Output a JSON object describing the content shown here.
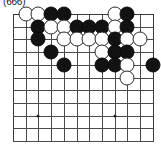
{
  "caption": {
    "text": "(666)"
  },
  "board": {
    "name": "go-board",
    "columns": 12,
    "rows": 11,
    "cell_size": 12.7,
    "origin_x": 3,
    "origin_y": 3,
    "line_color": "#4a4a4a",
    "background_color": "#ffffff",
    "black_color": "#121212",
    "white_color": "#ffffff",
    "star_points": [
      {
        "col": 3,
        "row": 9
      },
      {
        "col": 9,
        "row": 9
      }
    ],
    "stones": [
      {
        "color": "white",
        "col": 2,
        "row": 1
      },
      {
        "color": "white",
        "col": 3,
        "row": 1
      },
      {
        "color": "black",
        "col": 4,
        "row": 1
      },
      {
        "color": "black",
        "col": 5,
        "row": 1
      },
      {
        "color": "white",
        "col": 9,
        "row": 1
      },
      {
        "color": "black",
        "col": 10,
        "row": 1
      },
      {
        "color": "black",
        "col": 3,
        "row": 2
      },
      {
        "color": "white",
        "col": 4,
        "row": 2
      },
      {
        "color": "white",
        "col": 5,
        "row": 2
      },
      {
        "color": "black",
        "col": 6,
        "row": 2
      },
      {
        "color": "black",
        "col": 7,
        "row": 2
      },
      {
        "color": "black",
        "col": 8,
        "row": 2
      },
      {
        "color": "white",
        "col": 9,
        "row": 2
      },
      {
        "color": "black",
        "col": 10,
        "row": 2
      },
      {
        "color": "black",
        "col": 3,
        "row": 3
      },
      {
        "color": "white",
        "col": 5,
        "row": 3
      },
      {
        "color": "white",
        "col": 6,
        "row": 3
      },
      {
        "color": "white",
        "col": 7,
        "row": 3
      },
      {
        "color": "white",
        "col": 8,
        "row": 3
      },
      {
        "color": "black",
        "col": 9,
        "row": 3
      },
      {
        "color": "white",
        "col": 10,
        "row": 3
      },
      {
        "color": "white",
        "col": 11,
        "row": 3
      },
      {
        "color": "black",
        "col": 4,
        "row": 4
      },
      {
        "color": "white",
        "col": 8,
        "row": 4
      },
      {
        "color": "black",
        "col": 9,
        "row": 4
      },
      {
        "color": "black",
        "col": 10,
        "row": 4
      },
      {
        "color": "black",
        "col": 5,
        "row": 5
      },
      {
        "color": "black",
        "col": 8,
        "row": 5
      },
      {
        "color": "black",
        "col": 9,
        "row": 5
      },
      {
        "color": "white",
        "col": 10,
        "row": 5
      },
      {
        "color": "black",
        "col": 12,
        "row": 5
      },
      {
        "color": "white",
        "col": 10,
        "row": 6
      }
    ]
  }
}
